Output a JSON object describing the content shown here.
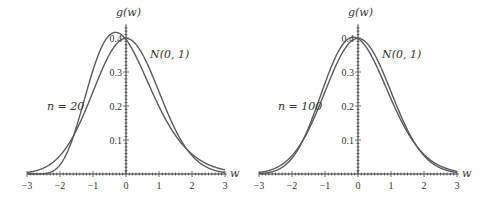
{
  "chart_data": [
    {
      "type": "line",
      "title": "",
      "xlabel": "w",
      "ylabel": "g(w)",
      "xlim": [
        -3,
        3
      ],
      "ylim": [
        0,
        0.42
      ],
      "xticks": [
        "−3",
        "−2",
        "−1",
        "0",
        "1",
        "2",
        "3"
      ],
      "yticks": [
        "0.1",
        "0.2",
        "0.3",
        "0.4"
      ],
      "grid": false,
      "series": [
        {
          "name": "n = 20",
          "description": "standardized chi-square density, n=20",
          "peak": {
            "x": -0.3,
            "y": 0.42
          }
        },
        {
          "name": "N(0, 1)",
          "description": "standard normal density",
          "peak": {
            "x": 0,
            "y": 0.399
          }
        }
      ],
      "annotations": [
        "n = 20",
        "N(0, 1)"
      ]
    },
    {
      "type": "line",
      "title": "",
      "xlabel": "w",
      "ylabel": "g(w)",
      "xlim": [
        -3,
        3
      ],
      "ylim": [
        0,
        0.42
      ],
      "xticks": [
        "−3",
        "−2",
        "−1",
        "0",
        "1",
        "2",
        "3"
      ],
      "yticks": [
        "0.1",
        "0.2",
        "0.3",
        "0.4"
      ],
      "grid": false,
      "series": [
        {
          "name": "n = 100",
          "description": "standardized chi-square density, n=100",
          "peak": {
            "x": -0.14,
            "y": 0.4
          }
        },
        {
          "name": "N(0, 1)",
          "description": "standard normal density",
          "peak": {
            "x": 0,
            "y": 0.399
          }
        }
      ],
      "annotations": [
        "n = 100",
        "N(0, 1)"
      ]
    }
  ],
  "panels": [
    {
      "n": 20,
      "n_label": "n = 20",
      "normal_label": "N(0, 1)",
      "ylabel": "g(w)",
      "xlabel": "w"
    },
    {
      "n": 100,
      "n_label": "n = 100",
      "normal_label": "N(0, 1)",
      "ylabel": "g(w)",
      "xlabel": "w"
    }
  ],
  "colors": {
    "curve": "#5a5a5a",
    "axis": "#333333"
  }
}
